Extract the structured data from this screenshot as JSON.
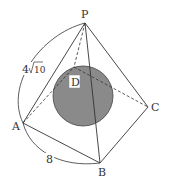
{
  "diagram": {
    "colors": {
      "line": "#333333",
      "sphere": "#8a8a8a",
      "background": "#ffffff"
    },
    "vertices": {
      "P": {
        "label": "P",
        "x": 85,
        "y": 23
      },
      "A": {
        "label": "A",
        "x": 23,
        "y": 123
      },
      "B": {
        "label": "B",
        "x": 100,
        "y": 163
      },
      "C": {
        "label": "C",
        "x": 148,
        "y": 107
      },
      "D": {
        "label": "D",
        "x": 74,
        "y": 67
      }
    },
    "sphere": {
      "cx": 83,
      "cy": 96,
      "r": 30
    },
    "edges_solid": [
      "PA",
      "PB",
      "PC",
      "AB",
      "BC"
    ],
    "edges_dashed": [
      "PD",
      "AD",
      "DC"
    ],
    "measurements": {
      "PA": "4√10",
      "PA_coef": "4",
      "PA_radicand": "10",
      "AB": "8"
    }
  }
}
